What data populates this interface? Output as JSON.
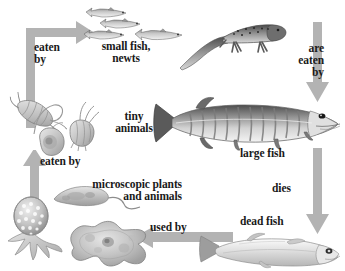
{
  "diagram": {
    "arrow_color": "#b3b3b3",
    "text_color": "#1a1a1a",
    "background": "#ffffff",
    "width": 345,
    "height": 271
  },
  "labels": {
    "eaten_by_top": "eaten\nby",
    "small_fish_newts": "small fish,\nnewts",
    "are_eaten_by": "are\neaten\nby",
    "tiny_animals": "tiny\nanimals",
    "large_fish": "large fish",
    "eaten_by_mid": "eaten by",
    "microscopic": "microscopic plants\nand animals",
    "dies": "dies",
    "dead_fish": "dead fish",
    "used_by": "used by"
  },
  "organisms": [
    {
      "name": "small-fish-group",
      "label": "small fish, newts",
      "count": 4
    },
    {
      "name": "newt",
      "label": "newt"
    },
    {
      "name": "large-fish",
      "label": "large fish"
    },
    {
      "name": "zooplankton-group",
      "label": "tiny animals",
      "count": 3
    },
    {
      "name": "microorganism-group",
      "label": "microscopic plants and animals",
      "count": 3
    },
    {
      "name": "dead-fish",
      "label": "dead fish"
    }
  ],
  "arrows": [
    {
      "name": "arrow-eaten-by-top",
      "from": "tiny animals",
      "to": "small fish, newts",
      "label": "eaten by",
      "shape": "up-then-right"
    },
    {
      "name": "arrow-are-eaten-by",
      "from": "small fish, newts",
      "to": "large fish",
      "label": "are eaten by",
      "shape": "down"
    },
    {
      "name": "arrow-dies",
      "from": "large fish",
      "to": "dead fish",
      "label": "dies",
      "shape": "down"
    },
    {
      "name": "arrow-used-by",
      "from": "dead fish",
      "to": "microscopic plants and animals",
      "label": "used by",
      "shape": "left"
    },
    {
      "name": "arrow-eaten-by-mid",
      "from": "microscopic plants and animals",
      "to": "tiny animals",
      "label": "eaten by",
      "shape": "up"
    }
  ]
}
